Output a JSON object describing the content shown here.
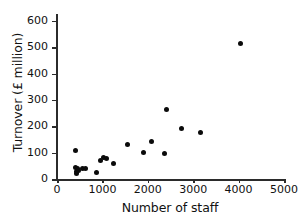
{
  "chart_data": {
    "type": "scatter",
    "title": "",
    "xlabel": "Number of staff",
    "ylabel": "Turnover (£ million)",
    "xlim": [
      0,
      5000
    ],
    "ylim": [
      0,
      620
    ],
    "grid": false,
    "legend": "none",
    "xticks": [
      0,
      1000,
      2000,
      3000,
      4000,
      5000
    ],
    "xticklabels": [
      "0",
      "1000",
      "2000",
      "3000",
      "4000",
      "5000"
    ],
    "yticks": [
      0,
      100,
      200,
      300,
      400,
      500,
      600
    ],
    "yticklabels": [
      "0",
      "100",
      "200",
      "300",
      "400",
      "500",
      "600"
    ],
    "marker": "filled-circle",
    "marker_color": "#0b0b0b",
    "points": [
      {
        "x": 400,
        "y": 110
      },
      {
        "x": 400,
        "y": 45
      },
      {
        "x": 420,
        "y": 30
      },
      {
        "x": 430,
        "y": 22
      },
      {
        "x": 450,
        "y": 38
      },
      {
        "x": 470,
        "y": 33
      },
      {
        "x": 560,
        "y": 40
      },
      {
        "x": 620,
        "y": 40
      },
      {
        "x": 880,
        "y": 25
      },
      {
        "x": 960,
        "y": 72
      },
      {
        "x": 1030,
        "y": 80
      },
      {
        "x": 1100,
        "y": 77
      },
      {
        "x": 1250,
        "y": 60
      },
      {
        "x": 1560,
        "y": 130
      },
      {
        "x": 1900,
        "y": 100
      },
      {
        "x": 2080,
        "y": 143
      },
      {
        "x": 2370,
        "y": 95
      },
      {
        "x": 2420,
        "y": 263
      },
      {
        "x": 2740,
        "y": 192
      },
      {
        "x": 3150,
        "y": 175
      },
      {
        "x": 4050,
        "y": 513
      }
    ]
  }
}
